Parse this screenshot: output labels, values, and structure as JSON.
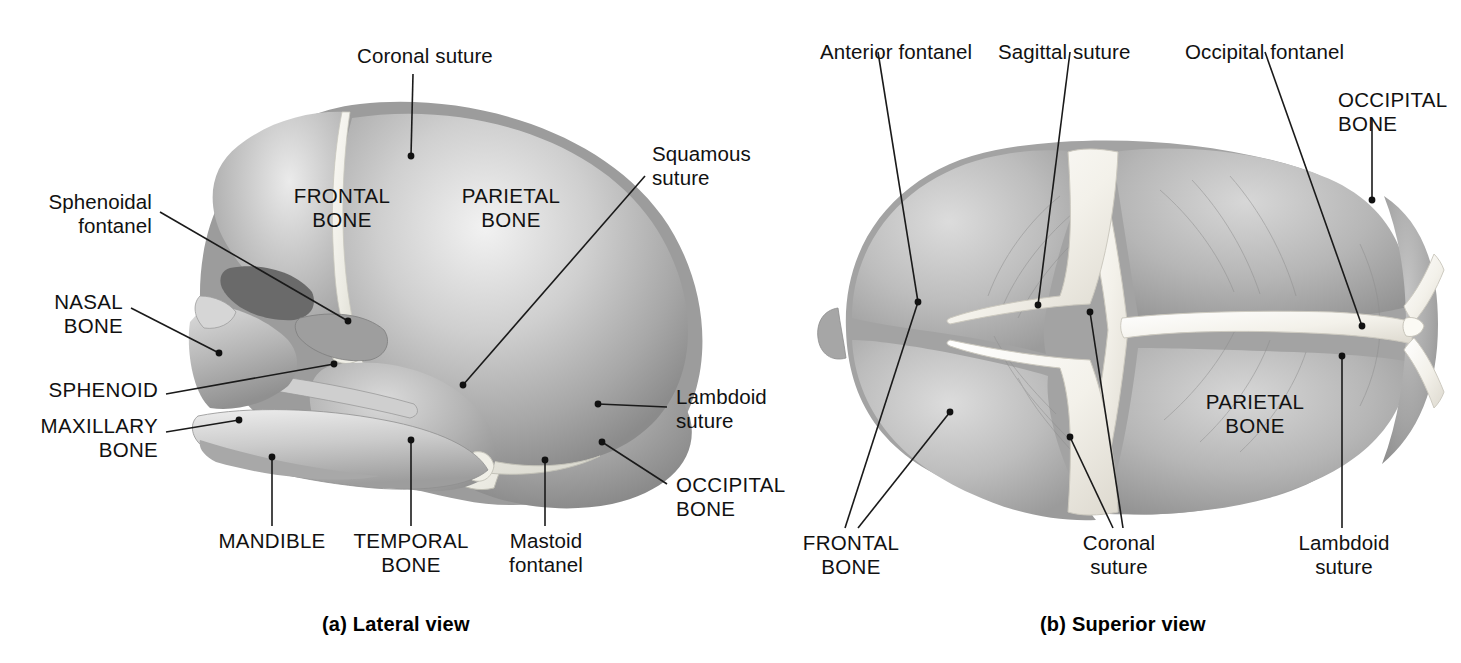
{
  "figure": {
    "type": "anatomical-illustration",
    "panels": [
      {
        "id": "a",
        "caption": "(a) Lateral view",
        "on_art_labels": [
          {
            "name": "frontal-bone",
            "text": "FRONTAL\nBONE"
          },
          {
            "name": "parietal-bone",
            "text": "PARIETAL\nBONE"
          }
        ],
        "callouts": [
          {
            "name": "coronal-suture",
            "text": "Coronal suture",
            "style": "sentence"
          },
          {
            "name": "sphenoidal-fontanel",
            "text": "Sphenoidal\nfontanel",
            "style": "sentence"
          },
          {
            "name": "nasal-bone",
            "text": "NASAL\nBONE",
            "style": "caps"
          },
          {
            "name": "sphenoid",
            "text": "SPHENOID",
            "style": "caps"
          },
          {
            "name": "maxillary-bone",
            "text": "MAXILLARY\nBONE",
            "style": "caps"
          },
          {
            "name": "mandible",
            "text": "MANDIBLE",
            "style": "caps"
          },
          {
            "name": "temporal-bone",
            "text": "TEMPORAL\nBONE",
            "style": "caps"
          },
          {
            "name": "mastoid-fontanel",
            "text": "Mastoid\nfontanel",
            "style": "sentence"
          },
          {
            "name": "squamous-suture",
            "text": "Squamous\nsuture",
            "style": "sentence"
          },
          {
            "name": "lambdoid-suture",
            "text": "Lambdoid\nsuture",
            "style": "sentence"
          },
          {
            "name": "occipital-bone",
            "text": "OCCIPITAL\nBONE",
            "style": "caps"
          }
        ]
      },
      {
        "id": "b",
        "caption": "(b) Superior view",
        "on_art_labels": [
          {
            "name": "parietal-bone",
            "text": "PARIETAL\nBONE"
          }
        ],
        "callouts": [
          {
            "name": "anterior-fontanel",
            "text": "Anterior fontanel",
            "style": "sentence"
          },
          {
            "name": "sagittal-suture",
            "text": "Sagittal suture",
            "style": "sentence"
          },
          {
            "name": "occipital-fontanel",
            "text": "Occipital fontanel",
            "style": "sentence"
          },
          {
            "name": "occipital-bone",
            "text": "OCCIPITAL\nBONE",
            "style": "caps"
          },
          {
            "name": "frontal-bone",
            "text": "FRONTAL\nBONE",
            "style": "caps"
          },
          {
            "name": "coronal-suture",
            "text": "Coronal\nsuture",
            "style": "sentence"
          },
          {
            "name": "lambdoid-suture",
            "text": "Lambdoid\nsuture",
            "style": "sentence"
          }
        ]
      }
    ]
  },
  "colors": {
    "background": "#ffffff",
    "text": "#111111",
    "leader_line": "#1a1a1a",
    "bone_light": "#e9e9e9",
    "bone_mid": "#b9b9b9",
    "bone_dark": "#8f8f8f",
    "bone_shadow": "#6e6e6e",
    "suture_highlight": "#f5f3ee"
  }
}
